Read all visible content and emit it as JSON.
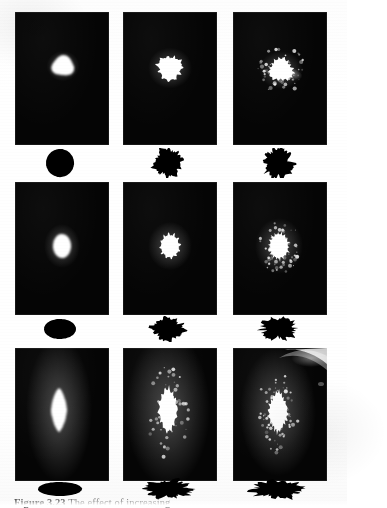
{
  "page": {
    "background_color": "#ffffff",
    "photo_color": "#050505",
    "blob_color": "#ffffff",
    "silhouette_color": "#000000",
    "caption_color": "#6d6d6d"
  },
  "caption": {
    "label": "Figure 3.23",
    "text": "The effect of increasing",
    "full": "Figure 3.23  The effect of increasing"
  },
  "layout": {
    "rows": 3,
    "columns": 3,
    "panel_width": 94,
    "panel_height": 133,
    "column_x": [
      15,
      123,
      233
    ],
    "row_photo_y": [
      12,
      182,
      348
    ],
    "row_silhouette_y": [
      148,
      316,
      478
    ]
  },
  "panels": [
    {
      "id": "panel-r1c1",
      "row": 1,
      "column": 1,
      "photo": {
        "x": 15,
        "y": 12,
        "width": 94,
        "height": 133
      },
      "blob": {
        "name": "round-smooth-spot",
        "shape": "round",
        "center_x": 48,
        "center_y": 54,
        "radius_x": 11,
        "radius_y": 10,
        "spikes": 0,
        "description": "smooth round bright spot"
      },
      "silhouette": {
        "name": "silhouette-round",
        "shape": "circle",
        "x": 15,
        "y": 148,
        "width": 94,
        "height": 30,
        "center_x": 45,
        "center_y": 15,
        "radius_x": 14,
        "radius_y": 14,
        "roughness": 0
      }
    },
    {
      "id": "panel-r1c2",
      "row": 1,
      "column": 2,
      "photo": {
        "x": 123,
        "y": 12,
        "width": 94,
        "height": 133
      },
      "blob": {
        "name": "spiky-round-spot",
        "shape": "spiky-round",
        "center_x": 47,
        "center_y": 56,
        "radius_x": 11,
        "radius_y": 11,
        "spikes": 11,
        "description": "round spot with radial spikes"
      },
      "silhouette": {
        "name": "silhouette-lobed-round",
        "shape": "lobed-circle",
        "x": 123,
        "y": 148,
        "width": 94,
        "height": 30,
        "center_x": 45,
        "center_y": 15,
        "radius_x": 13,
        "radius_y": 13,
        "roughness": 2.2
      }
    },
    {
      "id": "panel-r1c3",
      "row": 1,
      "column": 3,
      "photo": {
        "x": 233,
        "y": 12,
        "width": 94,
        "height": 133
      },
      "blob": {
        "name": "flared-spot",
        "shape": "flared",
        "center_x": 48,
        "center_y": 58,
        "radius_x": 11,
        "radius_y": 10,
        "spikes": 16,
        "description": "bright core with diffuse flare toward lower-right"
      },
      "silhouette": {
        "name": "silhouette-ragged-round",
        "shape": "ragged-circle",
        "x": 233,
        "y": 148,
        "width": 94,
        "height": 30,
        "center_x": 45,
        "center_y": 15,
        "radius_x": 13,
        "radius_y": 14,
        "roughness": 3.4
      }
    },
    {
      "id": "panel-r2c1",
      "row": 2,
      "column": 1,
      "photo": {
        "x": 15,
        "y": 182,
        "width": 94,
        "height": 133
      },
      "blob": {
        "name": "oval-smooth-spot",
        "shape": "oval",
        "center_x": 47,
        "center_y": 64,
        "radius_x": 9,
        "radius_y": 12,
        "spikes": 0,
        "description": "smooth vertical oval spot"
      },
      "silhouette": {
        "name": "silhouette-oval",
        "shape": "ellipse",
        "x": 15,
        "y": 316,
        "width": 94,
        "height": 26,
        "center_x": 45,
        "center_y": 13,
        "radius_x": 16,
        "radius_y": 10,
        "roughness": 0
      }
    },
    {
      "id": "panel-r2c2",
      "row": 2,
      "column": 2,
      "photo": {
        "x": 123,
        "y": 182,
        "width": 94,
        "height": 133
      },
      "blob": {
        "name": "spiky-oval-spot",
        "shape": "spiky-oval",
        "center_x": 47,
        "center_y": 64,
        "radius_x": 9,
        "radius_y": 11,
        "spikes": 12,
        "description": "oval spot with spikes"
      },
      "silhouette": {
        "name": "silhouette-lobed-oval",
        "shape": "lobed-ellipse",
        "x": 123,
        "y": 316,
        "width": 94,
        "height": 26,
        "center_x": 45,
        "center_y": 13,
        "radius_x": 15,
        "radius_y": 10,
        "roughness": 2.6
      }
    },
    {
      "id": "panel-r2c3",
      "row": 2,
      "column": 3,
      "photo": {
        "x": 233,
        "y": 182,
        "width": 94,
        "height": 133
      },
      "blob": {
        "name": "scattered-oval-spot",
        "shape": "scattered-oval",
        "center_x": 46,
        "center_y": 64,
        "radius_x": 9,
        "radius_y": 12,
        "spikes": 18,
        "description": "oval core with scattered speckle halo"
      },
      "silhouette": {
        "name": "silhouette-ragged-oval",
        "shape": "ragged-ellipse",
        "x": 233,
        "y": 316,
        "width": 94,
        "height": 26,
        "center_x": 45,
        "center_y": 13,
        "radius_x": 16,
        "radius_y": 10,
        "roughness": 3.6
      }
    },
    {
      "id": "panel-r3c1",
      "row": 3,
      "column": 1,
      "photo": {
        "x": 15,
        "y": 348,
        "width": 94,
        "height": 133
      },
      "blob": {
        "name": "elongated-diamond-spot",
        "shape": "diamond",
        "center_x": 44,
        "center_y": 62,
        "radius_x": 8,
        "radius_y": 22,
        "spikes": 0,
        "description": "elongated vertical diamond-shaped spot"
      },
      "silhouette": {
        "name": "silhouette-flat-ellipse",
        "shape": "ellipse",
        "x": 15,
        "y": 478,
        "width": 94,
        "height": 22,
        "center_x": 45,
        "center_y": 11,
        "radius_x": 22,
        "radius_y": 7,
        "roughness": 0
      }
    },
    {
      "id": "panel-r3c2",
      "row": 3,
      "column": 2,
      "photo": {
        "x": 123,
        "y": 348,
        "width": 94,
        "height": 133
      },
      "blob": {
        "name": "elongated-spiky-spot",
        "shape": "spiky-diamond",
        "center_x": 45,
        "center_y": 62,
        "radius_x": 9,
        "radius_y": 21,
        "spikes": 14,
        "description": "elongated spot with ragged spiky edges"
      },
      "silhouette": {
        "name": "silhouette-lobed-flat",
        "shape": "lobed-ellipse",
        "x": 123,
        "y": 478,
        "width": 94,
        "height": 22,
        "center_x": 45,
        "center_y": 11,
        "radius_x": 21,
        "radius_y": 8,
        "roughness": 3.0
      }
    },
    {
      "id": "panel-r3c3",
      "row": 3,
      "column": 3,
      "photo": {
        "x": 233,
        "y": 348,
        "width": 94,
        "height": 133
      },
      "blob": {
        "name": "elongated-scattered-spot",
        "shape": "scattered-diamond",
        "center_x": 45,
        "center_y": 64,
        "radius_x": 9,
        "radius_y": 19,
        "spikes": 20,
        "description": "elongated spot with heavy speckle scatter"
      },
      "artifact": {
        "name": "corner-flare",
        "description": "bright diagonal light streak in the upper-right corner of the plate",
        "position": "top-right"
      },
      "silhouette": {
        "name": "silhouette-ragged-flat",
        "shape": "ragged-ellipse",
        "x": 233,
        "y": 478,
        "width": 94,
        "height": 22,
        "center_x": 45,
        "center_y": 11,
        "radius_x": 23,
        "radius_y": 8,
        "roughness": 3.8
      }
    }
  ]
}
